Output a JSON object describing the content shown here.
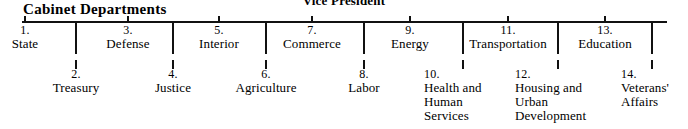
{
  "document": {
    "cut_off_heading": "Vice President",
    "chart_title": "Cabinet Departments"
  },
  "chart_data": {
    "type": "diagram",
    "title": "Cabinet Departments",
    "subtitle": "Vice President",
    "layout": "horizontal-spine-alternating",
    "note": "Fourteen United States executive Cabinet departments branching from a horizontal spine; odd-numbered items are labeled above the spine, even-numbered items below.",
    "nodes": [
      {
        "number": "1.",
        "name": "State",
        "row": "top",
        "x": 24
      },
      {
        "number": "2.",
        "name": "Treasury",
        "row": "bottom",
        "x": 75
      },
      {
        "number": "3.",
        "name": "Defense",
        "row": "top",
        "x": 127
      },
      {
        "number": "4.",
        "name": "Justice",
        "row": "bottom",
        "x": 172
      },
      {
        "number": "5.",
        "name": "Interior",
        "row": "top",
        "x": 218
      },
      {
        "number": "6.",
        "name": "Agriculture",
        "row": "bottom",
        "x": 265
      },
      {
        "number": "7.",
        "name": "Commerce",
        "row": "top",
        "x": 311
      },
      {
        "number": "8.",
        "name": "Labor",
        "row": "bottom",
        "x": 363
      },
      {
        "number": "9.",
        "name": "Energy",
        "row": "top",
        "x": 409
      },
      {
        "number": "10.",
        "name": "Health and Human Services",
        "row": "bottom",
        "x": 462
      },
      {
        "number": "11.",
        "name": "Transportation",
        "row": "top",
        "x": 507
      },
      {
        "number": "12.",
        "name": "Housing and Urban Development",
        "row": "bottom",
        "x": 557
      },
      {
        "number": "13.",
        "name": "Education",
        "row": "top",
        "x": 604
      },
      {
        "number": "14.",
        "name": "Veterans' Affairs",
        "row": "bottom",
        "x": 651
      }
    ],
    "colors": {
      "ink": "#111111",
      "background": "#ffffff"
    }
  }
}
